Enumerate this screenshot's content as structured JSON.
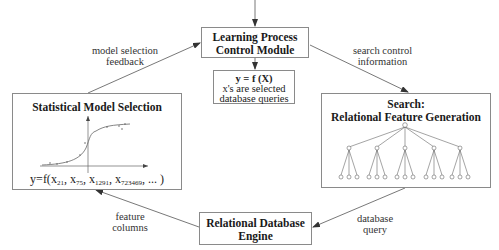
{
  "diagram": {
    "learning_module": {
      "title_line1": "Learning Process",
      "title_line2": "Control Module"
    },
    "function_box": {
      "formula": "y = f (X)",
      "line2": "x's are selected",
      "line3": "database queries"
    },
    "statistical_box": {
      "title": "Statistical Model Selection",
      "formula_prefix": "y=f(",
      "terms": [
        {
          "base": "x",
          "sub": "21"
        },
        {
          "base": "x",
          "sub": "75"
        },
        {
          "base": "x",
          "sub": "1291"
        },
        {
          "base": "x",
          "sub": "723469"
        }
      ],
      "formula_suffix": ", ... )"
    },
    "search_box": {
      "title_line1": "Search:",
      "title_line2": "Relational Feature Generation",
      "tree": {
        "root": 1,
        "children": 5,
        "leaves_per_child": 3
      }
    },
    "database_box": {
      "title_line1": "Relational Database",
      "title_line2": "Engine"
    },
    "edges": {
      "model_selection_feedback": {
        "line1": "model selection",
        "line2": "feedback"
      },
      "search_control_information": {
        "line1": "search control",
        "line2": "information"
      },
      "feature_columns": {
        "line1": "feature",
        "line2": "columns"
      },
      "database_query": {
        "line1": "database",
        "line2": "query"
      }
    },
    "colors": {
      "stroke": "#555555",
      "box_border": "#8a8a8a",
      "text": "#222222"
    }
  }
}
